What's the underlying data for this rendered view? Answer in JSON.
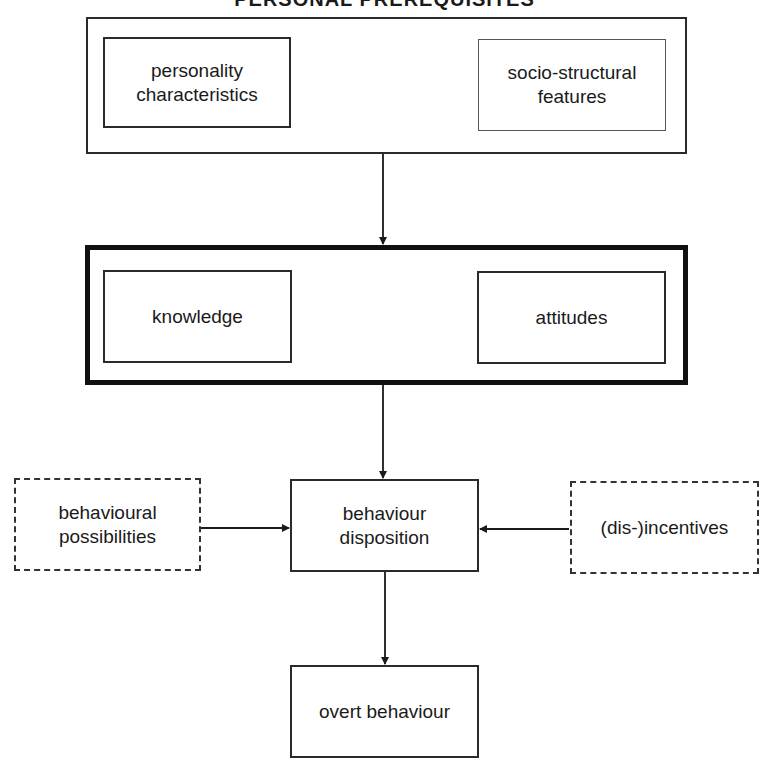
{
  "title": "PERSONAL PREREQUISITES",
  "top_group": {
    "left_box": "personality characteristics",
    "left_lines": [
      "personality",
      "characteristics"
    ],
    "right_box": "socio-structural features",
    "right_lines": [
      "socio-structural",
      "features"
    ]
  },
  "middle_group": {
    "left_box": "knowledge",
    "right_box": "attitudes"
  },
  "center_box": {
    "lines": [
      "behaviour",
      "disposition"
    ]
  },
  "left_side_box": {
    "lines": [
      "behavioural",
      "possibilities"
    ],
    "style": "dashed"
  },
  "right_side_box": {
    "label": "(dis-)incentives",
    "style": "dashed"
  },
  "bottom_box": {
    "label": "overt behaviour"
  },
  "edges": [
    {
      "from": "top_group",
      "to": "middle_group"
    },
    {
      "from": "middle_group",
      "to": "behaviour disposition"
    },
    {
      "from": "behavioural possibilities",
      "to": "behaviour disposition"
    },
    {
      "from": "(dis-)incentives",
      "to": "behaviour disposition"
    },
    {
      "from": "behaviour disposition",
      "to": "overt behaviour"
    }
  ]
}
